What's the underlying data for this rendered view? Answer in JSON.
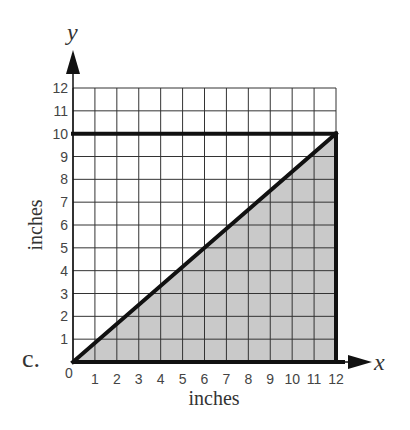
{
  "part_label": "c.",
  "colors": {
    "grid": "#333333",
    "line": "#111111",
    "fill": "#c9c9c9",
    "text": "#444444"
  },
  "chart_data": {
    "type": "area",
    "title": "",
    "xlabel": "inches",
    "ylabel": "inches",
    "x_axis_variable": "x",
    "y_axis_variable": "y",
    "xlim": [
      0,
      12
    ],
    "ylim": [
      0,
      12
    ],
    "x_ticks": [
      "0",
      "1",
      "2",
      "3",
      "4",
      "5",
      "6",
      "7",
      "8",
      "9",
      "10",
      "11",
      "12"
    ],
    "y_ticks": [
      "1",
      "2",
      "3",
      "4",
      "5",
      "6",
      "7",
      "8",
      "9",
      "10",
      "11",
      "12"
    ],
    "grid": true,
    "series": [
      {
        "name": "diagonal line (shaded region boundary)",
        "type": "line",
        "points": [
          [
            0,
            0
          ],
          [
            12,
            10
          ]
        ]
      },
      {
        "name": "horizontal line y=10",
        "type": "line",
        "points": [
          [
            0,
            10
          ],
          [
            12,
            10
          ]
        ]
      },
      {
        "name": "vertical line x=12",
        "type": "line",
        "points": [
          [
            12,
            0
          ],
          [
            12,
            10
          ]
        ]
      },
      {
        "name": "shaded triangle",
        "type": "area",
        "polygon": [
          [
            0,
            0
          ],
          [
            12,
            0
          ],
          [
            12,
            10
          ]
        ]
      }
    ]
  }
}
